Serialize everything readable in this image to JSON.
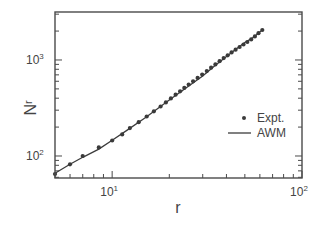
{
  "chart_data": {
    "type": "scatter",
    "title": "",
    "xlabel": "r",
    "ylabel": "N_r",
    "xscale": "log",
    "yscale": "log",
    "xlim": [
      5,
      100
    ],
    "ylim": [
      59,
      3160
    ],
    "grid": false,
    "legend_position": "center-right",
    "x_ticks": [
      {
        "base": "10",
        "exp": "1",
        "value": 10
      },
      {
        "base": "10",
        "exp": "2",
        "value": 100
      }
    ],
    "y_ticks": [
      {
        "base": "10",
        "exp": "2",
        "value": 100
      },
      {
        "base": "10",
        "exp": "3",
        "value": 1000
      }
    ],
    "series": [
      {
        "name": "Expt.",
        "style": "markers",
        "x": [
          5.0,
          6.0,
          7.0,
          8.5,
          10.0,
          11.3,
          12.4,
          13.8,
          15.2,
          16.6,
          18.0,
          19.2,
          20.4,
          21.6,
          22.8,
          24.0,
          25.3,
          26.7,
          28.2,
          29.8,
          31.5,
          33.2,
          35.0,
          36.8,
          38.7,
          40.6,
          42.6,
          44.7,
          46.9,
          49.2,
          51.5,
          54.0,
          56.5,
          59.0,
          61.8
        ],
        "y": [
          65,
          82,
          100,
          123,
          145,
          168,
          195,
          225,
          258,
          292,
          328,
          362,
          398,
          435,
          472,
          512,
          555,
          600,
          650,
          705,
          765,
          830,
          900,
          970,
          1045,
          1120,
          1200,
          1280,
          1365,
          1450,
          1540,
          1640,
          1760,
          1900,
          2050
        ]
      },
      {
        "name": "AWM",
        "style": "line",
        "x": [
          5.0,
          6.0,
          7.0,
          8.5,
          10.0,
          12.0,
          15.0,
          20.0,
          25.0,
          30.0,
          35.0,
          40.0,
          45.0,
          50.0,
          55.0,
          61.8
        ],
        "y": [
          66,
          82,
          97,
          118,
          146,
          186,
          252,
          382,
          525,
          680,
          880,
          1090,
          1300,
          1520,
          1700,
          2050
        ]
      }
    ]
  },
  "legend": {
    "items": [
      {
        "label": "Expt.",
        "marker": "dot"
      },
      {
        "label": "AWM",
        "marker": "line"
      }
    ]
  },
  "axes": {
    "x_title": "r",
    "y_title_main": "N",
    "y_title_sub": "r"
  }
}
